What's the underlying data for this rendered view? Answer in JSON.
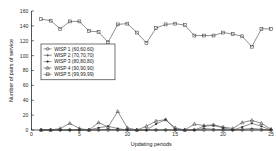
{
  "chart_data": {
    "type": "line",
    "title": "",
    "xlabel": "Updating periods",
    "ylabel": "Number of pairs of service",
    "xlim": [
      0,
      25
    ],
    "ylim": [
      0,
      160
    ],
    "xticks": [
      0,
      5,
      10,
      15,
      20,
      25
    ],
    "yticks": [
      0,
      20,
      40,
      60,
      80,
      100,
      120,
      140,
      160
    ],
    "grid": false,
    "legend_position": "upper-left",
    "x": [
      1,
      2,
      3,
      4,
      5,
      6,
      7,
      8,
      9,
      10,
      11,
      12,
      13,
      14,
      15,
      16,
      17,
      18,
      19,
      20,
      21,
      22,
      23,
      24,
      25
    ],
    "series": [
      {
        "name": "WISP 1 (60,60,60)",
        "marker": "circle-open",
        "values": [
          0,
          0,
          0,
          0,
          0,
          0,
          0,
          0,
          0,
          0,
          0,
          0,
          0,
          0,
          0,
          0,
          0,
          0,
          0,
          0,
          0,
          0,
          0,
          0,
          0
        ]
      },
      {
        "name": "WISP 2 (70,70,70)",
        "marker": "plus",
        "values": [
          0,
          0,
          0,
          0,
          0,
          0,
          0,
          1,
          0,
          0,
          0,
          0,
          0,
          0,
          0,
          0,
          0,
          2,
          1,
          0,
          0,
          1,
          2,
          1,
          0
        ]
      },
      {
        "name": "WISP 3 (80,80,80)",
        "marker": "asterisk",
        "values": [
          0,
          0,
          0,
          0,
          0,
          0,
          3,
          5,
          2,
          0,
          0,
          0,
          8,
          14,
          1,
          0,
          0,
          5,
          6,
          3,
          0,
          4,
          9,
          5,
          0
        ]
      },
      {
        "name": "WISP 4 (90,90,90)",
        "marker": "triangle-open",
        "values": [
          0,
          0,
          2,
          9,
          2,
          0,
          10,
          4,
          25,
          3,
          0,
          5,
          12,
          14,
          3,
          0,
          8,
          6,
          7,
          4,
          2,
          10,
          13,
          9,
          1
        ]
      },
      {
        "name": "WISP 5 (99,99,99)",
        "marker": "square-open",
        "values": [
          149,
          147,
          136,
          146,
          146,
          133,
          132,
          118,
          142,
          143,
          131,
          117,
          137,
          142,
          143,
          141,
          127,
          127,
          127,
          131,
          129,
          126,
          112,
          136,
          136
        ]
      }
    ]
  },
  "legend": {
    "entries": [
      {
        "label": "WISP 1 (60,60,60)"
      },
      {
        "label": "WISP 2 (70,70,70)"
      },
      {
        "label": "WISP 3 (80,80,80)"
      },
      {
        "label": "WISP 4 (90,90,90)"
      },
      {
        "label": "WISP 5 (99,99,99)"
      }
    ]
  }
}
